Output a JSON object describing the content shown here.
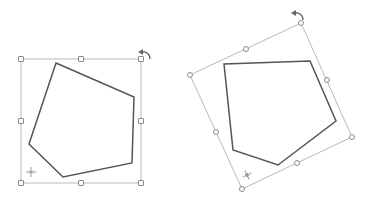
{
  "colors": {
    "shape_stroke": "#555555",
    "bbox_stroke": "#b9b9b9",
    "handle_stroke": "#8c8c8c",
    "background": "#ffffff"
  },
  "figures": [
    {
      "name": "original-pentagon",
      "rotation_deg": 0,
      "bbox": [
        [
          21,
          59
        ],
        [
          141,
          59
        ],
        [
          141,
          183
        ],
        [
          21,
          183
        ]
      ],
      "handles": [
        [
          21,
          59
        ],
        [
          81,
          59
        ],
        [
          141,
          59
        ],
        [
          141,
          121
        ],
        [
          141,
          183
        ],
        [
          81,
          183
        ],
        [
          21,
          183
        ],
        [
          21,
          121
        ]
      ],
      "pentagon": [
        [
          56,
          63
        ],
        [
          134,
          97
        ],
        [
          132,
          163
        ],
        [
          63,
          177
        ],
        [
          29,
          144
        ]
      ],
      "rotate_icon": [
        145,
        53
      ],
      "pivot_icon": [
        31,
        172
      ]
    },
    {
      "name": "rotated-pentagon",
      "rotation_deg": -25,
      "bbox": [
        [
          190,
          75
        ],
        [
          301,
          23
        ],
        [
          352,
          137
        ],
        [
          242,
          189
        ]
      ],
      "handles": [
        [
          190,
          75
        ],
        [
          246,
          49
        ],
        [
          301,
          23
        ],
        [
          327,
          80
        ],
        [
          352,
          137
        ],
        [
          297,
          163
        ],
        [
          242,
          189
        ],
        [
          216,
          132
        ]
      ],
      "pentagon": [
        [
          224,
          64
        ],
        [
          310,
          61
        ],
        [
          336,
          121
        ],
        [
          278,
          165
        ],
        [
          233,
          150
        ]
      ],
      "rotate_icon": [
        298,
        14
      ],
      "pivot_icon": [
        247,
        175
      ]
    }
  ]
}
